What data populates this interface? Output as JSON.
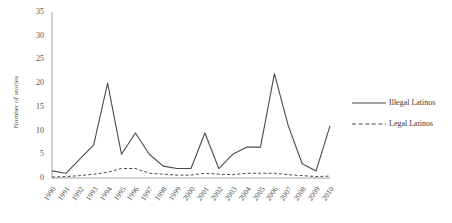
{
  "chart_data": {
    "type": "line",
    "title": "",
    "subtitle": "",
    "xlabel": "",
    "ylabel": "Number of stories",
    "x": [
      1990,
      1991,
      1992,
      1993,
      1994,
      1995,
      1996,
      1997,
      1998,
      1999,
      2000,
      2001,
      2002,
      2003,
      2004,
      2005,
      2006,
      2007,
      2008,
      2009,
      2010
    ],
    "categories": [
      "1990",
      "1991",
      "1992",
      "1993",
      "1994",
      "1995",
      "1996",
      "1997",
      "1998",
      "1999",
      "2000",
      "2001",
      "2002",
      "2003",
      "2004",
      "2005",
      "2006",
      "2007",
      "2008",
      "2009",
      "2010"
    ],
    "series": [
      {
        "name": "Illegal Latinos",
        "style": "solid",
        "color": "#4a4a4a",
        "values": [
          1.5,
          1,
          4,
          7,
          20,
          5,
          9.5,
          5,
          2.5,
          2,
          2,
          9.5,
          2,
          5,
          6.5,
          6.5,
          22,
          11,
          3,
          1.5,
          11
        ]
      },
      {
        "name": "Legal Latinos",
        "style": "dashed",
        "color": "#4a4a4a",
        "values": [
          0.2,
          0.3,
          0.5,
          0.8,
          1.2,
          2,
          2,
          1,
          0.8,
          0.6,
          0.6,
          1,
          0.8,
          0.7,
          1,
          1,
          1,
          0.7,
          0.5,
          0.3,
          0.4
        ]
      }
    ],
    "ylim": [
      0,
      35
    ],
    "yticks": [
      0,
      5,
      10,
      15,
      20,
      25,
      30,
      35
    ],
    "ytick_labels": [
      "0",
      "5",
      "10",
      "15",
      "20",
      "25",
      "30",
      "35"
    ],
    "grid": false,
    "legend_position": "right"
  },
  "legend": {
    "entries": [
      {
        "label": "Illegal Latinos",
        "style": "solid"
      },
      {
        "label": "Legal Latinos",
        "style": "dashed"
      }
    ]
  }
}
